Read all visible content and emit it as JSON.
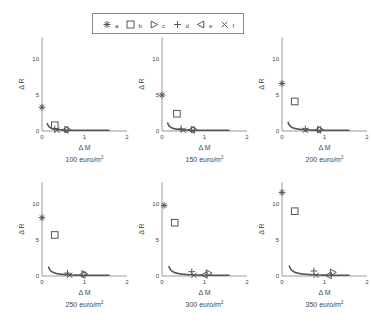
{
  "legend": {
    "items": [
      {
        "label": "a",
        "marker": "asterisk"
      },
      {
        "label": "b",
        "marker": "square"
      },
      {
        "label": "c",
        "marker": "triangle-right"
      },
      {
        "label": "d",
        "marker": "plus"
      },
      {
        "label": "e",
        "marker": "triangle-left"
      },
      {
        "label": "f",
        "marker": "x"
      }
    ]
  },
  "chart_data": [
    {
      "type": "scatter",
      "title": "100 euro/m²",
      "title_main": "100 euro/m",
      "title_sup": "2",
      "xlabel": "Δ M",
      "ylabel": "Δ R",
      "xlim": [
        0,
        2
      ],
      "ylim": [
        0,
        13
      ],
      "xticks": [
        "0",
        "1",
        "2"
      ],
      "yticks": [
        "0",
        "5",
        "10"
      ],
      "curve": {
        "k": 0.06,
        "x_from": 0.12,
        "x_to": 1.6
      },
      "series": [
        {
          "name": "a",
          "x": 0.0,
          "y": 3.3
        },
        {
          "name": "b",
          "x": 0.3,
          "y": 0.8
        },
        {
          "name": "c",
          "x": 0.6,
          "y": 0.2
        },
        {
          "name": "d",
          "x": 0.3,
          "y": 0.3
        },
        {
          "name": "e",
          "x": 0.55,
          "y": 0.15
        },
        {
          "name": "f",
          "x": 0.35,
          "y": 0.1
        }
      ]
    },
    {
      "type": "scatter",
      "title": "150 euro/m²",
      "title_main": "150 euro/m",
      "title_sup": "2",
      "xlabel": "Δ M",
      "ylabel": "Δ R",
      "xlim": [
        0,
        2
      ],
      "ylim": [
        0,
        13
      ],
      "xticks": [
        "0",
        "1",
        "2"
      ],
      "yticks": [
        "0",
        "5",
        "10"
      ],
      "curve": {
        "k": 0.07,
        "x_from": 0.13,
        "x_to": 1.6
      },
      "series": [
        {
          "name": "a",
          "x": 0.0,
          "y": 5.0
        },
        {
          "name": "b",
          "x": 0.35,
          "y": 2.4
        },
        {
          "name": "c",
          "x": 0.75,
          "y": 0.2
        },
        {
          "name": "d",
          "x": 0.45,
          "y": 0.3
        },
        {
          "name": "e",
          "x": 0.7,
          "y": 0.15
        },
        {
          "name": "f",
          "x": 0.5,
          "y": 0.1
        }
      ]
    },
    {
      "type": "scatter",
      "title": "200 euro/m²",
      "title_main": "200 euro/m",
      "title_sup": "2",
      "xlabel": "Δ M",
      "ylabel": "Δ R",
      "xlim": [
        0,
        2
      ],
      "ylim": [
        0,
        13
      ],
      "xticks": [
        "0",
        "1",
        "2"
      ],
      "yticks": [
        "0",
        "5",
        "10"
      ],
      "curve": {
        "k": 0.08,
        "x_from": 0.14,
        "x_to": 1.6
      },
      "series": [
        {
          "name": "a",
          "x": 0.0,
          "y": 6.6
        },
        {
          "name": "b",
          "x": 0.3,
          "y": 4.1
        },
        {
          "name": "c",
          "x": 0.9,
          "y": 0.2
        },
        {
          "name": "d",
          "x": 0.55,
          "y": 0.3
        },
        {
          "name": "e",
          "x": 0.85,
          "y": 0.15
        },
        {
          "name": "f",
          "x": 0.55,
          "y": 0.1
        }
      ]
    },
    {
      "type": "scatter",
      "title": "250 euro/m²",
      "title_main": "250 euro/m",
      "title_sup": "2",
      "xlabel": "Δ M",
      "ylabel": "Δ R",
      "xlim": [
        0,
        2
      ],
      "ylim": [
        0,
        13
      ],
      "xticks": [
        "0",
        "1",
        "2"
      ],
      "yticks": [
        "0",
        "5",
        "10"
      ],
      "curve": {
        "k": 0.09,
        "x_from": 0.15,
        "x_to": 1.6
      },
      "series": [
        {
          "name": "a",
          "x": 0.0,
          "y": 8.1
        },
        {
          "name": "b",
          "x": 0.3,
          "y": 5.7
        },
        {
          "name": "c",
          "x": 1.0,
          "y": 0.3
        },
        {
          "name": "d",
          "x": 0.6,
          "y": 0.4
        },
        {
          "name": "e",
          "x": 0.95,
          "y": 0.15
        },
        {
          "name": "f",
          "x": 0.65,
          "y": 0.1
        }
      ]
    },
    {
      "type": "scatter",
      "title": "300 euro/m²",
      "title_main": "300 euro/m",
      "title_sup": "2",
      "xlabel": "Δ M",
      "ylabel": "Δ R",
      "xlim": [
        0,
        2
      ],
      "ylim": [
        0,
        13
      ],
      "xticks": [
        "0",
        "1",
        "2"
      ],
      "yticks": [
        "0",
        "5",
        "10"
      ],
      "curve": {
        "k": 0.1,
        "x_from": 0.16,
        "x_to": 1.6
      },
      "series": [
        {
          "name": "a",
          "x": 0.05,
          "y": 9.8
        },
        {
          "name": "b",
          "x": 0.3,
          "y": 7.4
        },
        {
          "name": "c",
          "x": 1.1,
          "y": 0.4
        },
        {
          "name": "d",
          "x": 0.7,
          "y": 0.6
        },
        {
          "name": "e",
          "x": 1.0,
          "y": 0.15
        },
        {
          "name": "f",
          "x": 0.75,
          "y": 0.1
        }
      ]
    },
    {
      "type": "scatter",
      "title": "350 euro/m²",
      "title_main": "350 euro/m",
      "title_sup": "2",
      "xlabel": "Δ M",
      "ylabel": "Δ R",
      "xlim": [
        0,
        2
      ],
      "ylim": [
        0,
        13
      ],
      "xticks": [
        "0",
        "1",
        "2"
      ],
      "yticks": [
        "0",
        "5",
        "10"
      ],
      "curve": {
        "k": 0.11,
        "x_from": 0.17,
        "x_to": 1.6
      },
      "series": [
        {
          "name": "a",
          "x": 0.0,
          "y": 11.6
        },
        {
          "name": "b",
          "x": 0.3,
          "y": 9.0
        },
        {
          "name": "c",
          "x": 1.2,
          "y": 0.5
        },
        {
          "name": "d",
          "x": 0.75,
          "y": 0.7
        },
        {
          "name": "e",
          "x": 1.1,
          "y": 0.1
        },
        {
          "name": "f",
          "x": 0.8,
          "y": 0.1
        }
      ]
    }
  ]
}
